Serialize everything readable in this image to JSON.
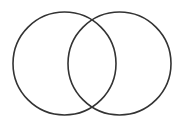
{
  "diagram": {
    "type": "venn",
    "set_count": 2,
    "background": "#ffffff",
    "stroke_color": "#333333",
    "stroke_width": 1.6,
    "circles": [
      {
        "name": "left-set",
        "cx": 64.5,
        "cy": 63.5,
        "r": 51.5
      },
      {
        "name": "right-set",
        "cx": 119.5,
        "cy": 63.5,
        "r": 51.5
      }
    ],
    "labels": []
  }
}
